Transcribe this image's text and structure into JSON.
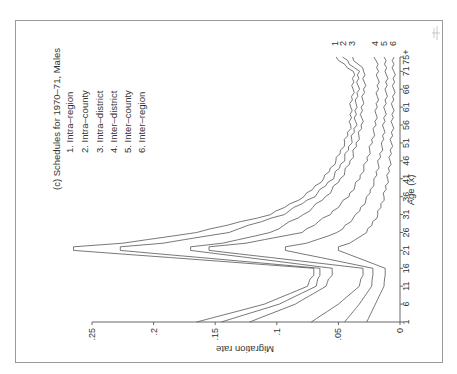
{
  "chart_data": {
    "type": "line",
    "xlabel": "Age (x)",
    "ylabel": "Migration rate",
    "orientation": "rotated 90° counterclockwise on page",
    "x": [
      1,
      6,
      11,
      16,
      21,
      26,
      31,
      36,
      41,
      46,
      51,
      56,
      61,
      66,
      71,
      75
    ],
    "x_tick_labels": [
      "1",
      "6",
      "11",
      "16",
      "21",
      "26",
      "31",
      "36",
      "41",
      "46",
      "51",
      "56",
      "61",
      "66",
      "71",
      "75+"
    ],
    "y_tick_labels": [
      "0",
      ".05",
      ".1",
      ".15",
      ".2",
      ".25"
    ],
    "ylim": [
      0,
      0.25
    ],
    "grid": false,
    "legend_position": "top-left (in rotated frame)",
    "series": [
      {
        "id": "1",
        "name": "1. Intra-region",
        "values": [
          0.165,
          0.11,
          0.075,
          0.07,
          0.265,
          0.165,
          0.105,
          0.078,
          0.062,
          0.052,
          0.045,
          0.04,
          0.04,
          0.038,
          0.038,
          0.053
        ]
      },
      {
        "id": "2",
        "name": "2. Intra-county",
        "values": [
          0.145,
          0.098,
          0.068,
          0.065,
          0.227,
          0.14,
          0.095,
          0.07,
          0.055,
          0.046,
          0.04,
          0.036,
          0.036,
          0.034,
          0.034,
          0.046
        ]
      },
      {
        "id": "3",
        "name": "3. Intra-district",
        "values": [
          0.122,
          0.085,
          0.06,
          0.055,
          0.17,
          0.105,
          0.078,
          0.06,
          0.048,
          0.04,
          0.035,
          0.031,
          0.031,
          0.029,
          0.029,
          0.039
        ]
      },
      {
        "id": "4",
        "name": "4. Inter-district",
        "values": [
          0.072,
          0.05,
          0.033,
          0.03,
          0.155,
          0.08,
          0.057,
          0.042,
          0.033,
          0.027,
          0.023,
          0.02,
          0.019,
          0.018,
          0.018,
          0.02
        ]
      },
      {
        "id": "5",
        "name": "5. Inter-county",
        "values": [
          0.045,
          0.033,
          0.023,
          0.022,
          0.093,
          0.05,
          0.035,
          0.026,
          0.02,
          0.017,
          0.014,
          0.013,
          0.012,
          0.011,
          0.011,
          0.013
        ]
      },
      {
        "id": "6",
        "name": "6. Inter-region",
        "values": [
          0.027,
          0.02,
          0.013,
          0.012,
          0.05,
          0.027,
          0.018,
          0.013,
          0.01,
          0.008,
          0.007,
          0.006,
          0.006,
          0.005,
          0.005,
          0.006
        ]
      }
    ]
  },
  "legend": {
    "title": "(c) Schedules for 1970–71, Males",
    "items": [
      "1. Intra–region",
      "2. Intra–county",
      "3. Intra–district",
      "4. Inter–district",
      "5. Inter–county",
      "6. Inter–region"
    ]
  },
  "axes": {
    "x_label": "Age (x)",
    "y_label": "Migration rate"
  },
  "end_labels": [
    "1",
    "2",
    "3",
    "4",
    "5",
    "6"
  ],
  "colors": {
    "line": "#555555",
    "frame": "#9a9a9a",
    "text": "#333333"
  }
}
